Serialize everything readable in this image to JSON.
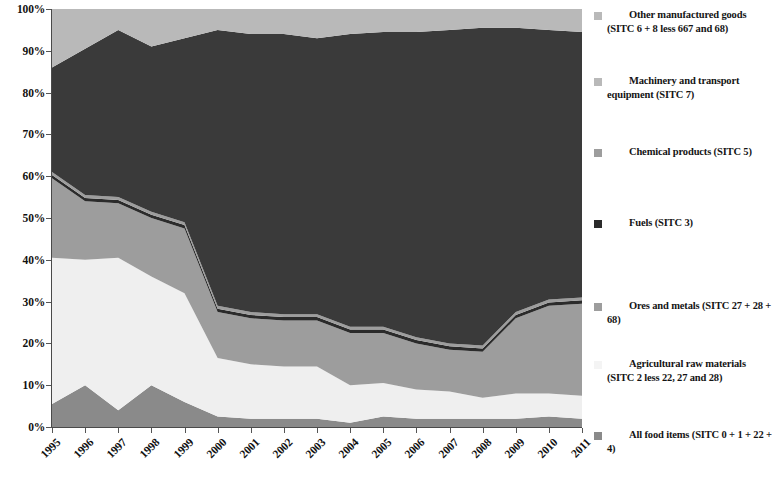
{
  "chart_data": {
    "type": "area",
    "title": "",
    "xlabel": "",
    "ylabel": "",
    "stacked": true,
    "stack_order_top_to_bottom": [
      "Other manufactured goods (SITC 6 + 8 less 667 and 68)",
      "Machinery and transport equipment (SITC 7)",
      "Chemical products (SITC 5)",
      "Fuels (SITC 3)",
      "Ores and metals (SITC 27 + 28 + 68)",
      "Agricultural raw materials (SITC 2 less 22, 27 and 28)",
      "All food items (SITC 0 + 1 + 22 + 4)"
    ],
    "ylim": [
      0,
      100
    ],
    "ytick_labels": [
      "0%",
      "10%",
      "20%",
      "30%",
      "40%",
      "50%",
      "60%",
      "70%",
      "80%",
      "90%",
      "100%"
    ],
    "ytick_values": [
      0,
      10,
      20,
      30,
      40,
      50,
      60,
      70,
      80,
      90,
      100
    ],
    "grid": false,
    "legend_position": "right",
    "x": [
      1995,
      1996,
      1997,
      1998,
      1999,
      2000,
      2001,
      2002,
      2003,
      2004,
      2005,
      2006,
      2007,
      2008,
      2009,
      2010,
      2011
    ],
    "categories": [
      "1995",
      "1996",
      "1997",
      "1998",
      "1999",
      "2000",
      "2001",
      "2002",
      "2003",
      "2004",
      "2005",
      "2006",
      "2007",
      "2008",
      "2009",
      "2010",
      "2011"
    ],
    "series": [
      {
        "name": "All food items (SITC 0 + 1 + 22 + 4)",
        "color": "#8a8a8a",
        "values": [
          5.5,
          10.0,
          4.0,
          10.0,
          6.0,
          2.5,
          2.0,
          2.0,
          2.0,
          1.0,
          2.5,
          2.0,
          2.0,
          2.0,
          2.0,
          2.5,
          2.0
        ]
      },
      {
        "name": "Agricultural raw materials (SITC 2 less 22, 27 and 28)",
        "color": "#efefef",
        "values": [
          35.0,
          30.0,
          36.5,
          26.0,
          26.0,
          14.0,
          13.0,
          12.5,
          12.5,
          9.0,
          8.0,
          7.0,
          6.5,
          5.0,
          6.0,
          5.5,
          5.5
        ]
      },
      {
        "name": "Ores and metals (SITC 27 + 28 + 68)",
        "color": "#9d9d9d",
        "values": [
          19.0,
          14.0,
          13.0,
          14.0,
          15.5,
          11.0,
          11.0,
          11.0,
          11.0,
          12.5,
          12.0,
          11.0,
          10.0,
          11.0,
          18.0,
          21.0,
          22.0
        ]
      },
      {
        "name": "Fuels (SITC 3)",
        "color": "#2b2b2b",
        "values": [
          0.8,
          0.8,
          0.8,
          0.8,
          0.8,
          0.8,
          0.8,
          0.8,
          0.8,
          0.8,
          0.8,
          0.8,
          0.8,
          0.8,
          0.8,
          0.8,
          0.8
        ]
      },
      {
        "name": "Chemical products (SITC 5)",
        "color": "#9d9d9d",
        "values": [
          0.7,
          0.7,
          0.7,
          0.7,
          0.7,
          0.7,
          0.7,
          0.7,
          0.7,
          0.7,
          0.7,
          0.7,
          0.7,
          0.7,
          0.7,
          0.7,
          0.7
        ]
      },
      {
        "name": "Machinery and transport equipment (SITC 7)",
        "color": "#3a3a3a",
        "values": [
          25.0,
          35.0,
          40.0,
          39.5,
          44.0,
          66.0,
          66.5,
          67.0,
          66.0,
          70.0,
          70.5,
          73.0,
          75.0,
          76.0,
          68.0,
          64.5,
          63.5
        ]
      },
      {
        "name": "Other manufactured goods (SITC 6 + 8 less 667 and 68)",
        "color": "#b9b9b9",
        "values": [
          14.0,
          9.5,
          5.0,
          9.0,
          7.0,
          5.0,
          6.0,
          6.0,
          7.0,
          6.0,
          6.5,
          5.5,
          5.0,
          4.5,
          4.5,
          5.0,
          5.5
        ]
      }
    ],
    "cumulative_top_boundaries_percent": {
      "note": "Upper edge of each band measured from 0% baseline, top-of-stack = 100%",
      "all_food_top": [
        5.5,
        10.0,
        4.0,
        10.0,
        6.0,
        2.5,
        2.0,
        2.0,
        2.0,
        1.0,
        2.5,
        2.0,
        2.0,
        2.0,
        2.0,
        2.5,
        2.0
      ],
      "agricultural_top": [
        40.5,
        40.0,
        40.5,
        36.0,
        32.0,
        16.5,
        15.0,
        14.5,
        14.5,
        10.0,
        10.5,
        9.0,
        8.5,
        7.0,
        8.0,
        8.0,
        7.5
      ],
      "ores_metals_top": [
        59.5,
        54.0,
        53.5,
        50.0,
        47.5,
        27.5,
        26.0,
        25.5,
        25.5,
        22.5,
        22.5,
        20.0,
        18.5,
        18.0,
        26.0,
        29.0,
        29.5
      ],
      "fuels_top": [
        60.3,
        54.8,
        54.3,
        50.8,
        48.3,
        28.3,
        26.8,
        26.3,
        26.3,
        23.3,
        23.3,
        20.8,
        19.3,
        18.8,
        26.8,
        29.8,
        30.3
      ],
      "chemical_top": [
        61.0,
        55.5,
        55.0,
        51.5,
        49.0,
        29.0,
        27.5,
        27.0,
        27.0,
        24.0,
        24.0,
        21.5,
        20.0,
        19.5,
        27.5,
        30.5,
        31.0
      ],
      "machinery_top": [
        86.0,
        90.5,
        95.0,
        91.0,
        93.0,
        95.0,
        94.0,
        94.0,
        93.0,
        94.0,
        94.5,
        94.5,
        95.0,
        95.5,
        95.5,
        95.0,
        94.5
      ],
      "other_manufactured_top": [
        100,
        100,
        100,
        100,
        100,
        100,
        100,
        100,
        100,
        100,
        100,
        100,
        100,
        100,
        100,
        100,
        100
      ]
    }
  },
  "axes": {
    "y_ticks": [
      {
        "label": "100%",
        "value": 100
      },
      {
        "label": "90%",
        "value": 90
      },
      {
        "label": "80%",
        "value": 80
      },
      {
        "label": "70%",
        "value": 70
      },
      {
        "label": "60%",
        "value": 60
      },
      {
        "label": "50%",
        "value": 50
      },
      {
        "label": "40%",
        "value": 40
      },
      {
        "label": "30%",
        "value": 30
      },
      {
        "label": "20%",
        "value": 20
      },
      {
        "label": "10%",
        "value": 10
      },
      {
        "label": "0%",
        "value": 0
      }
    ],
    "x_ticks": [
      "1995",
      "1996",
      "1997",
      "1998",
      "1999",
      "2000",
      "2001",
      "2002",
      "2003",
      "2004",
      "2005",
      "2006",
      "2007",
      "2008",
      "2009",
      "2010",
      "2011"
    ]
  },
  "legend": {
    "items": [
      {
        "label": "Other manufactured goods (SITC 6 + 8 less 667 and 68)",
        "color": "#b9b9b9",
        "top": 8,
        "indent": true
      },
      {
        "label": "Machinery and transport equipment (SITC 7)",
        "color": "#b9b9b9",
        "top": 74,
        "indent": true
      },
      {
        "label": "Chemical products (SITC 5)",
        "color": "#9d9d9d",
        "top": 145,
        "indent": true
      },
      {
        "label": "Fuels (SITC 3)",
        "color": "#2b2b2b",
        "top": 216,
        "indent": true
      },
      {
        "label": "Ores and metals (SITC 27 + 28 + 68)",
        "color": "#9d9d9d",
        "top": 299,
        "indent": true
      },
      {
        "label": "Agricultural raw materials (SITC 2 less 22, 27 and 28)",
        "color": "#f4f4f4",
        "top": 357,
        "indent": true
      },
      {
        "label": "All food items (SITC 0 + 1 + 22 + 4)",
        "color": "#8a8a8a",
        "top": 428,
        "indent": true
      }
    ]
  },
  "colors": {
    "other_manufactured": "#b9b9b9",
    "machinery": "#3a3a3a",
    "chemical": "#9d9d9d",
    "fuels": "#2b2b2b",
    "ores_metals": "#9d9d9d",
    "agricultural": "#efefef",
    "all_food": "#8a8a8a",
    "axis": "#4a4a4a",
    "text": "#141414"
  }
}
